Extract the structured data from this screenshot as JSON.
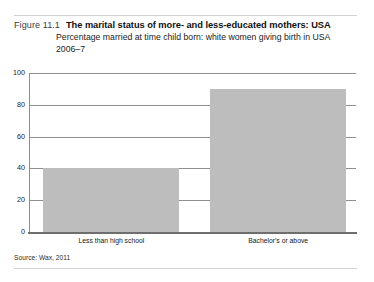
{
  "figure": {
    "number_label": "Figure 11.1",
    "title": "The marital status of more- and less-educated mothers: USA",
    "subtitle": "Percentage married at time child born: white women giving birth in USA 2006–7",
    "source": "Source: Wax, 2011"
  },
  "colors": {
    "bar_fill": "#bdbdbd",
    "gridline": "#8e8e8e",
    "axis": "#6e6e6e",
    "rule": "#d2d2d2",
    "text": "#111111"
  },
  "chart_data": {
    "type": "bar",
    "title": "The marital status of more- and less-educated mothers: USA",
    "subtitle": "Percentage married at time child born: white women giving birth in USA 2006–7",
    "xlabel": "",
    "ylabel": "",
    "categories": [
      "Less than high school",
      "Bachelor's or above"
    ],
    "values": [
      40,
      90
    ],
    "ylim": [
      0,
      100
    ],
    "yticks": [
      0,
      20,
      40,
      60,
      80,
      100
    ],
    "ytick_labels": [
      "0",
      "20",
      "40",
      "60",
      "80",
      "100"
    ],
    "grid": true,
    "legend": false,
    "source": "Source: Wax, 2011"
  }
}
